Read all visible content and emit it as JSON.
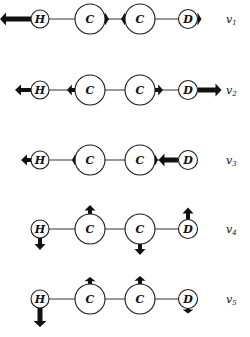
{
  "figure": {
    "atoms": [
      {
        "label": "H",
        "x": 40,
        "r": 9
      },
      {
        "label": "C",
        "x": 90,
        "r": 15
      },
      {
        "label": "C",
        "x": 140,
        "r": 15
      },
      {
        "label": "D",
        "x": 188,
        "r": 9.5
      }
    ],
    "modes": [
      {
        "label": "v",
        "subscript": "1",
        "y": 19,
        "displacements": [
          {
            "atom": 0,
            "dir": "left",
            "length": 31,
            "width": 5
          },
          {
            "atom": 1,
            "dir": "right",
            "length": 4,
            "width": 5
          },
          {
            "atom": 2,
            "dir": "left",
            "length": 4,
            "width": 5
          },
          {
            "atom": 3,
            "dir": "right",
            "length": 4,
            "width": 5
          }
        ]
      },
      {
        "label": "v",
        "subscript": "2",
        "y": 90,
        "displacements": [
          {
            "atom": 0,
            "dir": "left",
            "length": 16,
            "width": 4
          },
          {
            "atom": 1,
            "dir": "left",
            "length": 8,
            "width": 4
          },
          {
            "atom": 2,
            "dir": "right",
            "length": 8,
            "width": 4
          },
          {
            "atom": 3,
            "dir": "right",
            "length": 24,
            "width": 5
          }
        ]
      },
      {
        "label": "v",
        "subscript": "3",
        "y": 160,
        "displacements": [
          {
            "atom": 0,
            "dir": "left",
            "length": 10,
            "width": 4
          },
          {
            "atom": 1,
            "dir": "left",
            "length": 3,
            "width": 4
          },
          {
            "atom": 2,
            "dir": "right",
            "length": 3,
            "width": 4
          },
          {
            "atom": 3,
            "dir": "left",
            "length": 20,
            "width": 5
          }
        ]
      },
      {
        "label": "v",
        "subscript": "4",
        "y": 229,
        "displacements": [
          {
            "atom": 0,
            "dir": "down",
            "length": 12,
            "width": 4
          },
          {
            "atom": 1,
            "dir": "up",
            "length": 9,
            "width": 4
          },
          {
            "atom": 2,
            "dir": "down",
            "length": 11,
            "width": 4
          },
          {
            "atom": 3,
            "dir": "up",
            "length": 12,
            "width": 4
          }
        ]
      },
      {
        "label": "v",
        "subscript": "5",
        "y": 299,
        "displacements": [
          {
            "atom": 0,
            "dir": "down",
            "length": 19,
            "width": 5
          },
          {
            "atom": 1,
            "dir": "up",
            "length": 7,
            "width": 4
          },
          {
            "atom": 2,
            "dir": "up",
            "length": 8,
            "width": 4
          },
          {
            "atom": 3,
            "dir": "down",
            "length": 5,
            "width": 4
          }
        ]
      }
    ],
    "label_x": 226,
    "colors": {
      "stroke": "#1a1a1a",
      "arrow": "#111111",
      "background": "#ffffff"
    }
  }
}
